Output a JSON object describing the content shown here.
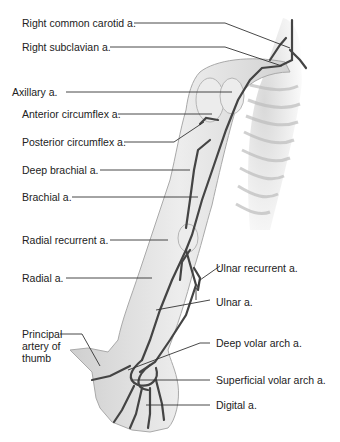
{
  "diagram": {
    "labels_left": [
      {
        "id": "rcc",
        "text": "Right common carotid a."
      },
      {
        "id": "rsub",
        "text": "Right subclavian a."
      },
      {
        "id": "axil",
        "text": "Axillary a."
      },
      {
        "id": "antc",
        "text": "Anterior circumflex a."
      },
      {
        "id": "postc",
        "text": "Posterior circumflex a."
      },
      {
        "id": "deepb",
        "text": "Deep brachial a."
      },
      {
        "id": "brach",
        "text": "Brachial a."
      },
      {
        "id": "radrec",
        "text": "Radial recurrent a."
      },
      {
        "id": "radial",
        "text": "Radial a."
      },
      {
        "id": "thumb",
        "text": "Principal artery of thumb"
      }
    ],
    "labels_right": [
      {
        "id": "ulnrec",
        "text": "Ulnar recurrent a."
      },
      {
        "id": "ulnar",
        "text": "Ulnar a."
      },
      {
        "id": "deepv",
        "text": "Deep volar arch a."
      },
      {
        "id": "supv",
        "text": "Superficial volar arch a."
      },
      {
        "id": "digit",
        "text": "Digital a."
      }
    ],
    "colors": {
      "line": "#333333",
      "artery": "#4a4a4a",
      "skin": "#d9d9d9",
      "bone": "#ececec"
    }
  }
}
